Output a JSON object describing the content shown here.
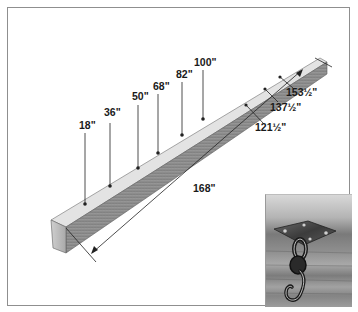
{
  "diagram": {
    "total_length_label": "168\"",
    "top_marks": [
      {
        "label": "18\"",
        "value_in": 18
      },
      {
        "label": "36\"",
        "value_in": 36
      },
      {
        "label": "50\"",
        "value_in": 50
      },
      {
        "label": "68\"",
        "value_in": 68
      },
      {
        "label": "82\"",
        "value_in": 82
      },
      {
        "label": "100\"",
        "value_in": 100
      }
    ],
    "side_marks": [
      {
        "label": "121½\"",
        "value_in": 121.5
      },
      {
        "label": "137½\"",
        "value_in": 137.5
      },
      {
        "label": "153½\"",
        "value_in": 153.5
      }
    ],
    "inset_photo": {
      "description": "Metal mounting plate with swivel and S-hook screwed to underside of beam"
    },
    "colors": {
      "frame": "#8f8f8f",
      "beam_top": "#e2e2e2",
      "beam_front": "#8a8a8a",
      "beam_end": "#bdbdbd",
      "lines": "#222222"
    }
  }
}
